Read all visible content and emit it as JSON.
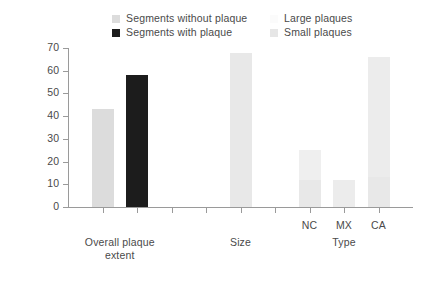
{
  "chart_data": {
    "type": "bar",
    "title": "",
    "xlabel": "",
    "ylabel": "Number of diseased segments",
    "ylim": [
      0,
      70
    ],
    "yticks": [
      0,
      10,
      20,
      30,
      40,
      50,
      60,
      70
    ],
    "grid": false,
    "legend_position": "top-center",
    "legend": [
      {
        "label": "Segments without plaque",
        "color": "#dcdcdc"
      },
      {
        "label": "Segments with plaque",
        "color": "#1c1c1c"
      },
      {
        "label": "Large plaques",
        "color": "#fbfbfb"
      },
      {
        "label": "Small plaques",
        "color": "#e6e6e6"
      }
    ],
    "groups": [
      {
        "name": "Overall plaque extent",
        "categories": [
          "Segments without plaque",
          "Segments with plaque"
        ],
        "values": [
          43,
          58
        ]
      },
      {
        "name": "Size",
        "categories": [
          "Size"
        ],
        "values": [
          68
        ]
      },
      {
        "name": "Type",
        "categories": [
          "NC",
          "MX",
          "CA"
        ],
        "values": [
          25,
          12,
          66
        ]
      }
    ],
    "bars": [
      {
        "name": "Segments without plaque",
        "group": "Overall plaque extent",
        "tick": 1,
        "total": 43,
        "segments": [
          {
            "series": "Segments without plaque",
            "value": 43,
            "color": "#dcdcdc"
          }
        ]
      },
      {
        "name": "Segments with plaque",
        "group": "Overall plaque extent",
        "tick": 2,
        "total": 58,
        "segments": [
          {
            "series": "Segments with plaque",
            "value": 58,
            "color": "#1c1c1c"
          }
        ]
      },
      {
        "name": "Size",
        "group": "Size",
        "tick": 5,
        "total": 68,
        "segments": [
          {
            "series": "Small plaques",
            "value": 68,
            "color": "#e8e8e8"
          }
        ]
      },
      {
        "name": "NC",
        "group": "Type",
        "tick": 7,
        "total": 25,
        "segments": [
          {
            "series": "Small plaques",
            "value": 12,
            "color": "#e8e8e8"
          },
          {
            "series": "Large plaques",
            "value": 13,
            "color": "#efefef"
          }
        ]
      },
      {
        "name": "MX",
        "group": "Type",
        "tick": 8,
        "total": 12,
        "segments": [
          {
            "series": "Small plaques",
            "value": 12,
            "color": "#ececec"
          }
        ]
      },
      {
        "name": "CA",
        "group": "Type",
        "tick": 9,
        "total": 66,
        "segments": [
          {
            "series": "Small plaques",
            "value": 13,
            "color": "#e8e8e8"
          },
          {
            "series": "Large plaques",
            "value": 53,
            "color": "#ececec"
          }
        ]
      }
    ],
    "x_tick_count": 9,
    "x_category_labels": [
      {
        "label": "NC",
        "tick": 7
      },
      {
        "label": "MX",
        "tick": 8
      },
      {
        "label": "CA",
        "tick": 9
      }
    ],
    "x_group_labels": [
      {
        "label": "Overall plaque",
        "label2": "extent",
        "tick": 1.5
      },
      {
        "label": "Size",
        "label2": "",
        "tick": 5
      },
      {
        "label": "Type",
        "label2": "",
        "tick": 8
      }
    ]
  }
}
